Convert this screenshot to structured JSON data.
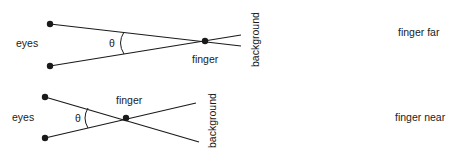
{
  "diagram": {
    "colors": {
      "line": "#1a1a1a",
      "background": "#ffffff"
    },
    "top": {
      "eyes_label": "eyes",
      "angle_label": "θ",
      "finger_label": "finger",
      "background_label": "background",
      "caption": "finger far"
    },
    "bottom": {
      "eyes_label": "eyes",
      "angle_label": "θ",
      "finger_label": "finger",
      "background_label": "background",
      "caption": "finger near"
    }
  }
}
